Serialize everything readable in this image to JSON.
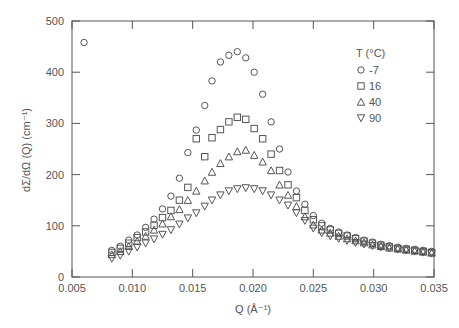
{
  "chart_data": {
    "type": "scatter",
    "title": "",
    "xlabel": "Q (Å⁻¹)",
    "ylabel": "dΣ/dΩ (Q) (cm⁻¹)",
    "xlim": [
      0.005,
      0.035
    ],
    "ylim": [
      0,
      500
    ],
    "xticks": [
      0.005,
      0.01,
      0.015,
      0.02,
      0.025,
      0.03,
      0.035
    ],
    "xtick_labels": [
      "0.005",
      "0.010",
      "0.015",
      "0.020",
      "0.025",
      "0.030",
      "0.035"
    ],
    "yticks": [
      0,
      100,
      200,
      300,
      400,
      500
    ],
    "ytick_labels": [
      "0",
      "100",
      "200",
      "300",
      "400",
      "500"
    ],
    "grid": false,
    "legend": {
      "title": "T (°C)",
      "position": "upper right"
    },
    "x": [
      0.0083,
      0.009,
      0.0097,
      0.0104,
      0.0111,
      0.0118,
      0.0125,
      0.0132,
      0.0139,
      0.0146,
      0.0153,
      0.016,
      0.0166,
      0.0173,
      0.018,
      0.0187,
      0.0194,
      0.0201,
      0.0208,
      0.0215,
      0.0222,
      0.0229,
      0.0236,
      0.0243,
      0.025,
      0.0257,
      0.0264,
      0.0271,
      0.0278,
      0.0285,
      0.0292,
      0.0299,
      0.0306,
      0.0313,
      0.032,
      0.0327,
      0.0334,
      0.0341,
      0.0348
    ],
    "series": [
      {
        "name": "-7",
        "marker": "circle",
        "extra_points": [
          [
            0.006,
            458
          ]
        ],
        "values": [
          52,
          60,
          72,
          82,
          97,
          113,
          133,
          158,
          193,
          243,
          287,
          335,
          383,
          420,
          433,
          440,
          428,
          400,
          357,
          303,
          250,
          205,
          168,
          142,
          120,
          105,
          95,
          88,
          82,
          77,
          72,
          68,
          64,
          61,
          58,
          56,
          54,
          52,
          50
        ]
      },
      {
        "name": "16",
        "marker": "square",
        "values": [
          48,
          56,
          66,
          77,
          88,
          101,
          116,
          130,
          150,
          175,
          270,
          235,
          272,
          288,
          303,
          312,
          308,
          290,
          270,
          240,
          208,
          180,
          155,
          130,
          112,
          100,
          92,
          85,
          80,
          75,
          70,
          66,
          62,
          59,
          56,
          54,
          52,
          50,
          48
        ]
      },
      {
        "name": "40",
        "marker": "triangle-up",
        "values": [
          44,
          50,
          60,
          70,
          80,
          92,
          104,
          118,
          132,
          150,
          168,
          188,
          205,
          222,
          235,
          245,
          248,
          238,
          225,
          208,
          180,
          160,
          138,
          118,
          102,
          92,
          86,
          80,
          75,
          71,
          67,
          63,
          60,
          57,
          55,
          53,
          51,
          49,
          47
        ]
      },
      {
        "name": "90",
        "marker": "triangle-down",
        "values": [
          36,
          42,
          50,
          58,
          66,
          74,
          83,
          92,
          103,
          115,
          125,
          138,
          150,
          160,
          168,
          172,
          174,
          172,
          168,
          160,
          150,
          140,
          125,
          110,
          95,
          86,
          80,
          75,
          71,
          67,
          64,
          61,
          58,
          56,
          54,
          52,
          50,
          48,
          46
        ]
      }
    ]
  }
}
